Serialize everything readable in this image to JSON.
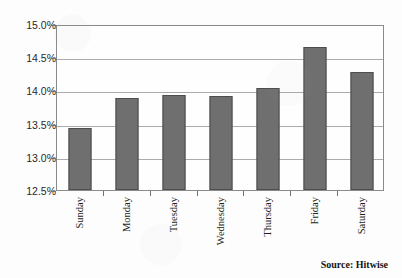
{
  "chart_data": {
    "type": "bar",
    "title": "",
    "xlabel": "",
    "ylabel": "",
    "categories": [
      "Sunday",
      "Monday",
      "Tuesday",
      "Wednesday",
      "Thursday",
      "Friday",
      "Saturday"
    ],
    "values": [
      13.43,
      13.89,
      13.93,
      13.92,
      14.04,
      14.66,
      14.28
    ],
    "ylim": [
      12.5,
      15.0
    ],
    "ytick_values": [
      12.5,
      13.0,
      13.5,
      14.0,
      14.5,
      15.0
    ],
    "ytick_labels": [
      "12.5%",
      "13.0%",
      "13.5%",
      "14.0%",
      "14.5%",
      "15.0%"
    ],
    "grid": true,
    "legend": false,
    "bar_color": "#6f6f6f",
    "bar_edge_color": "#4d4d4d",
    "gridline_color": "#a9abad",
    "axis_color": "#888a8c",
    "plot_background": "#fefefe"
  },
  "annotations": {
    "source_note": "Source: Hitwise"
  }
}
